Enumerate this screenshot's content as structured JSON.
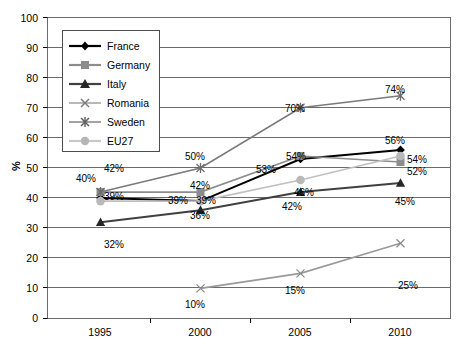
{
  "chart_data": {
    "type": "line",
    "title": "",
    "xlabel": "",
    "ylabel": "%",
    "categories": [
      "1995",
      "2000",
      "2005",
      "2010"
    ],
    "x": [
      1995,
      2000,
      2005,
      2010
    ],
    "ylim": [
      0,
      100
    ],
    "ytick_step": 10,
    "yticks": [
      "100",
      "90",
      "80",
      "70",
      "60",
      "50",
      "40",
      "30",
      "20",
      "10",
      "0"
    ],
    "grid": "horizontal",
    "legend_position": "top-left-inside",
    "series": [
      {
        "name": "France",
        "marker": "diamond",
        "color": "#000000",
        "values": [
          40,
          39,
          53,
          56
        ],
        "labels": [
          "40%",
          "39%",
          "53%",
          "56%"
        ]
      },
      {
        "name": "Germany",
        "marker": "square",
        "color": "#8c8c8c",
        "values": [
          42,
          42,
          54,
          52
        ],
        "labels": [
          "42%",
          "42%",
          "54%",
          "52%"
        ]
      },
      {
        "name": "Italy",
        "marker": "triangle",
        "color": "#404040",
        "values": [
          32,
          36,
          42,
          45
        ],
        "labels": [
          "32%",
          "36%",
          "42%",
          "45%"
        ]
      },
      {
        "name": "Romania",
        "marker": "x",
        "color": "#9a9a9a",
        "values": [
          null,
          10,
          15,
          25
        ],
        "labels": [
          "",
          "10%",
          "15%",
          "25%"
        ]
      },
      {
        "name": "Sweden",
        "marker": "asterisk",
        "color": "#7a7a7a",
        "values": [
          42,
          50,
          70,
          74
        ],
        "labels": [
          "42%",
          "50%",
          "70%",
          "74%"
        ]
      },
      {
        "name": "EU27",
        "marker": "circle",
        "color": "#c0c0c0",
        "values": [
          39,
          39,
          46,
          54
        ],
        "labels": [
          "39%",
          "39%",
          "46%",
          "54%"
        ]
      }
    ],
    "annotations": [
      {
        "text": "42%",
        "x": 104,
        "y": 164
      },
      {
        "text": "40%",
        "x": 76,
        "y": 174
      },
      {
        "text": "39%",
        "x": 104,
        "y": 192
      },
      {
        "text": "32%",
        "x": 104,
        "y": 240
      },
      {
        "text": "50%",
        "x": 185,
        "y": 152
      },
      {
        "text": "42%",
        "x": 190,
        "y": 181
      },
      {
        "text": "39%",
        "x": 168,
        "y": 196
      },
      {
        "text": "39%",
        "x": 196,
        "y": 196
      },
      {
        "text": "36%",
        "x": 190,
        "y": 211
      },
      {
        "text": "10%",
        "x": 185,
        "y": 300
      },
      {
        "text": "53%",
        "x": 256,
        "y": 165
      },
      {
        "text": "54%",
        "x": 286,
        "y": 152
      },
      {
        "text": "46%",
        "x": 294,
        "y": 188
      },
      {
        "text": "42%",
        "x": 282,
        "y": 202
      },
      {
        "text": "70%",
        "x": 285,
        "y": 104
      },
      {
        "text": "15%",
        "x": 285,
        "y": 286
      },
      {
        "text": "74%",
        "x": 385,
        "y": 85
      },
      {
        "text": "56%",
        "x": 385,
        "y": 136
      },
      {
        "text": "54%",
        "x": 407,
        "y": 155
      },
      {
        "text": "52%",
        "x": 407,
        "y": 167
      },
      {
        "text": "45%",
        "x": 395,
        "y": 197
      },
      {
        "text": "25%",
        "x": 398,
        "y": 281
      }
    ]
  }
}
